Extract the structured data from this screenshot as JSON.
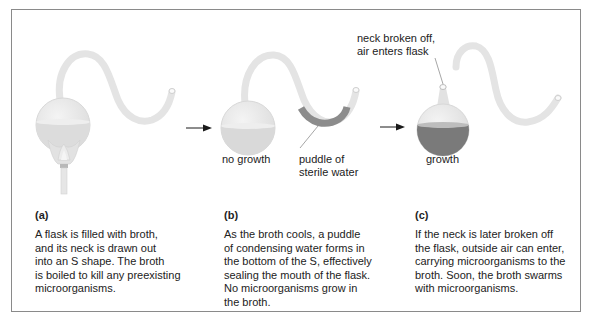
{
  "figure": {
    "colors": {
      "border": "#8a8a8a",
      "glass": "#e6e6e6",
      "glass_edge": "#d4d4d4",
      "broth_clear": "#d9d9d9",
      "broth_contaminated": "#7a7a7a",
      "puddle": "#8c8c8c",
      "arrow": "#1a1a1a"
    },
    "callouts": {
      "no_growth": "no growth",
      "puddle_line1": "puddle of",
      "puddle_line2": "sterile water",
      "neck_line1": "neck broken off,",
      "neck_line2": "air enters flask",
      "growth": "growth"
    },
    "panels": [
      {
        "tag": "(a)",
        "lines": [
          "A flask is filled with broth,",
          "and its neck is drawn out",
          "into an S shape. The broth",
          "is boiled to kill any preexisting",
          "microorganisms."
        ]
      },
      {
        "tag": "(b)",
        "lines": [
          "As the broth cools, a puddle",
          "of condensing water forms in",
          "the bottom of the S, effectively",
          "sealing the mouth of the flask.",
          "No microorganisms grow in",
          "the broth."
        ]
      },
      {
        "tag": "(c)",
        "lines": [
          "If the neck is later broken off",
          "the flask, outside air can enter,",
          "carrying microorganisms to the",
          "broth. Soon, the broth swarms",
          "with microorganisms."
        ]
      }
    ]
  }
}
